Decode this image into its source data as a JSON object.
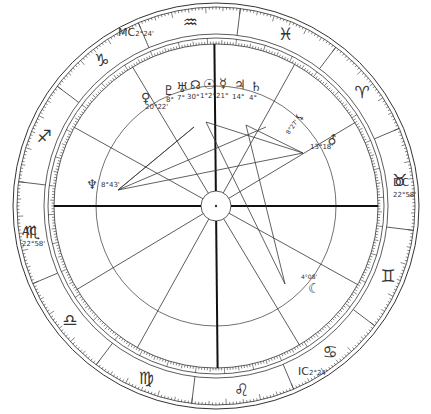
{
  "chart": {
    "type": "natal-chart-wheel",
    "center": [
      216,
      206
    ],
    "rotation_offset_deg": 180,
    "ascendant_longitude": 232.97,
    "radii": {
      "outer": 203,
      "outer_inner": 199,
      "sign_inner": 172,
      "ring_outer": 168,
      "ring_inner": 162,
      "aspect": 120,
      "hub": 15
    },
    "colors": {
      "line": "#333333",
      "axis": "#111111",
      "aspect": "#3a3a3a",
      "text": "#333333"
    }
  },
  "zodiac": [
    {
      "name": "aries",
      "glyph": "♈"
    },
    {
      "name": "taurus",
      "glyph": "♉"
    },
    {
      "name": "gemini",
      "glyph": "♊"
    },
    {
      "name": "cancer",
      "glyph": "♋"
    },
    {
      "name": "leo",
      "glyph": "♌"
    },
    {
      "name": "virgo",
      "glyph": "♍"
    },
    {
      "name": "libra",
      "glyph": "♎"
    },
    {
      "name": "scorpio",
      "glyph": "♏"
    },
    {
      "name": "sagittarius",
      "glyph": "♐"
    },
    {
      "name": "capricorn",
      "glyph": "♑"
    },
    {
      "name": "aquarius",
      "glyph": "♒"
    },
    {
      "name": "pisces",
      "glyph": "♓"
    }
  ],
  "angles": {
    "ac": {
      "label": "AC",
      "degree": "22°58'"
    },
    "dc": {
      "label": "DC",
      "degree": "22°58'"
    },
    "mc": {
      "label": "MC",
      "degree": "2°24'"
    },
    "ic": {
      "label": "IC",
      "degree": "2°24'"
    }
  },
  "house_cusps": [
    232.97,
    262,
    292,
    322.4,
    352,
    22,
    52.97,
    82,
    112,
    142.4,
    172,
    202
  ],
  "planets": [
    {
      "name": "pluto",
      "glyph": "♇",
      "degree": "8°"
    },
    {
      "name": "uranus",
      "glyph": "♅",
      "degree": "7°"
    },
    {
      "name": "north-node",
      "glyph": "☊",
      "degree": "30°"
    },
    {
      "name": "sun",
      "glyph": "☉",
      "degree": "1°2°"
    },
    {
      "name": "mercury",
      "glyph": "☿",
      "degree": "21°"
    },
    {
      "name": "jupiter",
      "glyph": "♃",
      "degree": "14°"
    },
    {
      "name": "saturn",
      "glyph": "♄",
      "degree": "4°"
    },
    {
      "name": "venus",
      "glyph": "♀",
      "degree": "20°22'"
    },
    {
      "name": "neptune",
      "glyph": "♆",
      "degree": "8°43'"
    },
    {
      "name": "lilith",
      "glyph": "⚸",
      "degree": "8°27'"
    },
    {
      "name": "mars",
      "glyph": "♂",
      "degree": "13°18'"
    },
    {
      "name": "moon",
      "glyph": "☾",
      "degree": "4°08'"
    }
  ]
}
